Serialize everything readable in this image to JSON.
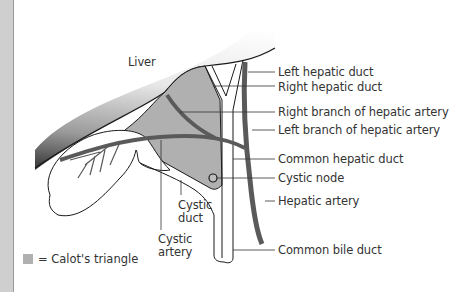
{
  "diagram": {
    "colors": {
      "calot_triangle_fill": "#b0b0b0",
      "artery": "#5a5a5a",
      "outline": "#1a1a1a",
      "sidebar": "#cfcfcf"
    },
    "labels": {
      "liver": "Liver",
      "left_hepatic_duct": "Left hepatic duct",
      "right_hepatic_duct": "Right hepatic duct",
      "right_branch_hepatic_artery": "Right branch of hepatic artery",
      "left_branch_hepatic_artery": "Left branch of hepatic artery",
      "common_hepatic_duct": "Common hepatic duct",
      "cystic_node": "Cystic node",
      "hepatic_artery": "Hepatic artery",
      "common_bile_duct": "Common bile duct",
      "cystic_duct_line1": "Cystic",
      "cystic_duct_line2": "duct",
      "cystic_artery_line1": "Cystic",
      "cystic_artery_line2": "artery"
    },
    "legend": {
      "text": "= Calot's triangle"
    }
  }
}
